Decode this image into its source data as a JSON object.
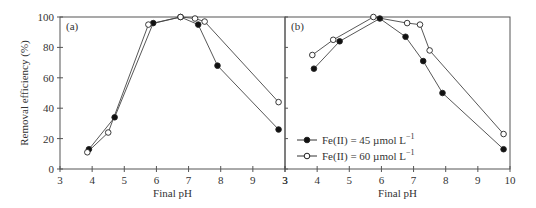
{
  "figure": {
    "ylabel": "Removal efficiency (%)",
    "xlabel": "Final pH",
    "legend": [
      {
        "label": "Fe(II) = 45 µmol L",
        "sup": "−1",
        "marker": "filled-circle"
      },
      {
        "label": "Fe(II) = 60 µmol L",
        "sup": "−1",
        "marker": "open-circle"
      }
    ]
  },
  "chart_data": [
    {
      "type": "line",
      "panel_label": "(a)",
      "title": "",
      "xlabel": "Final pH",
      "ylabel": "Removal efficiency (%)",
      "xlim": [
        3,
        10
      ],
      "ylim": [
        0,
        100
      ],
      "xticks": [
        3,
        4,
        5,
        6,
        7,
        8,
        9,
        3
      ],
      "yticks": [
        0,
        20,
        40,
        60,
        80,
        100
      ],
      "grid": false,
      "series": [
        {
          "name": "Fe(II) = 45 µmol L−1",
          "marker": "filled",
          "x": [
            3.9,
            4.7,
            5.9,
            6.75,
            7.3,
            7.9,
            9.8
          ],
          "y": [
            13,
            34,
            96,
            100,
            95,
            68,
            26
          ]
        },
        {
          "name": "Fe(II) = 60 µmol L−1",
          "marker": "open",
          "x": [
            3.85,
            4.5,
            5.75,
            6.75,
            7.2,
            7.5,
            9.8
          ],
          "y": [
            11,
            24,
            95,
            100,
            99,
            97,
            44
          ]
        }
      ]
    },
    {
      "type": "line",
      "panel_label": "(b)",
      "title": "",
      "xlabel": "Final pH",
      "ylabel": "",
      "xlim": [
        3,
        10
      ],
      "ylim": [
        0,
        100
      ],
      "xticks": [
        3,
        4,
        5,
        6,
        7,
        8,
        9,
        10
      ],
      "yticks": [
        0,
        20,
        40,
        60,
        80,
        100
      ],
      "grid": false,
      "legend_position": "lower left",
      "series": [
        {
          "name": "Fe(II) = 45 µmol L−1",
          "marker": "filled",
          "x": [
            3.9,
            4.7,
            5.95,
            6.75,
            7.3,
            7.9,
            9.8
          ],
          "y": [
            66,
            84,
            99,
            87,
            71,
            50,
            13
          ]
        },
        {
          "name": "Fe(II) = 60 µmol L−1",
          "marker": "open",
          "x": [
            3.85,
            4.5,
            5.75,
            6.8,
            7.2,
            7.5,
            9.8
          ],
          "y": [
            75,
            85,
            100,
            96,
            95,
            78,
            23
          ]
        }
      ]
    }
  ]
}
